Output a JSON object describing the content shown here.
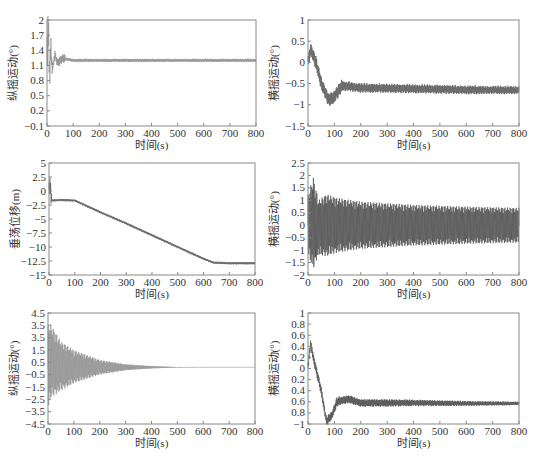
{
  "chart_data": [
    {
      "id": "top-left",
      "type": "line",
      "title": "",
      "xlabel": "时间(s)",
      "ylabel": "纵摇运动(°)",
      "xlim": [
        0,
        800
      ],
      "ylim": [
        -0.1,
        2
      ],
      "xticks": [
        0,
        100,
        200,
        300,
        400,
        500,
        600,
        700,
        800
      ],
      "yticks": [
        2,
        1.7,
        1.4,
        1.1,
        0.8,
        0.5,
        0.2,
        -0.1
      ],
      "ytick_labels": [
        "2",
        "1.7",
        "1.4",
        "1.1",
        "0.8",
        "0.5",
        "0.2",
        "−0.1"
      ],
      "grid": false,
      "color": "#8a8a8a",
      "description": "Damped oscillation: large swings 0.8–1.95 in first 20 s, settling by ~60 s to a steady ~1.2 with small ±0.03 ripple",
      "series": [
        {
          "name": "pitch",
          "x": [
            0,
            5,
            10,
            15,
            20,
            30,
            40,
            60,
            100,
            200,
            400,
            600,
            800
          ],
          "y": [
            1.1,
            1.95,
            0.85,
            1.5,
            1.0,
            1.32,
            1.15,
            1.24,
            1.2,
            1.2,
            1.2,
            1.2,
            1.2
          ]
        }
      ]
    },
    {
      "id": "top-right",
      "type": "line",
      "title": "",
      "xlabel": "时间(s)",
      "ylabel": "横摇运动(°)",
      "xlim": [
        0,
        800
      ],
      "ylim": [
        -1.5,
        1
      ],
      "xticks": [
        0,
        100,
        200,
        300,
        400,
        500,
        600,
        700,
        800
      ],
      "yticks": [
        1,
        0.5,
        0,
        -0.5,
        -1,
        -1.5
      ],
      "ytick_labels": [
        "1",
        "0.5",
        "0",
        "−0.5",
        "−1",
        "−1.5"
      ],
      "grid": false,
      "color": "#555555",
      "description": "Dense oscillation; peaks ~0.5 near 10 s, drifts down to ~-1.1 at 80 s, recovers to band -0.4..-0.8 around 120 s, then narrows to -0.55..-0.75 by 800 s; final spike to -1.2",
      "series": [
        {
          "name": "roll-mean",
          "x": [
            0,
            10,
            30,
            50,
            80,
            100,
            130,
            200,
            400,
            600,
            800
          ],
          "y": [
            0,
            0.3,
            0,
            -0.5,
            -0.9,
            -0.8,
            -0.55,
            -0.6,
            -0.62,
            -0.65,
            -0.65
          ]
        }
      ]
    },
    {
      "id": "middle-left",
      "type": "line",
      "title": "",
      "xlabel": "时间(s)",
      "ylabel": "垂荡位移(m)",
      "xlim": [
        0,
        800
      ],
      "ylim": [
        -15,
        5
      ],
      "xticks": [
        0,
        100,
        200,
        300,
        400,
        500,
        600,
        700,
        800
      ],
      "yticks": [
        5,
        2.5,
        0,
        -2.5,
        -5,
        -7.5,
        -10,
        -12.5,
        -15
      ],
      "ytick_labels": [
        "5",
        "2.5",
        "0",
        "−2.5",
        "−5",
        "−7.5",
        "−10",
        "−12.5",
        "−15"
      ],
      "grid": false,
      "color": "#555555",
      "description": "Initial transient 1 to -3 at t<10 s, plateau ~-1.7 until 100 s, linear descent to ~-12.8 at 640 s, then flat ~-12.9 to 800 s",
      "series": [
        {
          "name": "heave",
          "x": [
            0,
            5,
            10,
            50,
            100,
            200,
            300,
            400,
            500,
            600,
            640,
            700,
            800
          ],
          "y": [
            0,
            1,
            -1.7,
            -1.6,
            -1.7,
            -3.8,
            -5.8,
            -7.9,
            -10.0,
            -12.1,
            -12.8,
            -12.9,
            -12.9
          ]
        }
      ]
    },
    {
      "id": "middle-right",
      "type": "line",
      "title": "",
      "xlabel": "时间(s)",
      "ylabel": "横摇运动(°)",
      "xlim": [
        0,
        800
      ],
      "ylim": [
        -2,
        2.5
      ],
      "xticks": [
        0,
        100,
        200,
        300,
        400,
        500,
        600,
        700,
        800
      ],
      "yticks": [
        2.5,
        2,
        1.5,
        1,
        0.5,
        0,
        -0.5,
        -1,
        -1.5,
        -2
      ],
      "ytick_labels": [
        "2.5",
        "2",
        "1.5",
        "1",
        "0.5",
        "0",
        "−0.5",
        "−1",
        "−1.5",
        "−2"
      ],
      "grid": false,
      "color": "#444444",
      "description": "Dense oscillation about 0; envelope ±1.9 near 20 s, ±1.2 at 70–110 s, decaying to about ±0.7 by 800 s",
      "series": [
        {
          "name": "upper-envelope",
          "x": [
            0,
            20,
            40,
            70,
            110,
            200,
            400,
            600,
            800
          ],
          "y": [
            1.2,
            1.95,
            1.0,
            1.25,
            1.1,
            0.95,
            0.82,
            0.75,
            0.7
          ]
        },
        {
          "name": "lower-envelope",
          "x": [
            0,
            20,
            40,
            70,
            110,
            200,
            400,
            600,
            800
          ],
          "y": [
            -1.2,
            -1.75,
            -1.2,
            -1.25,
            -1.1,
            -0.95,
            -0.82,
            -0.75,
            -0.7
          ]
        }
      ]
    },
    {
      "id": "bottom-left",
      "type": "line",
      "title": "",
      "xlabel": "时间(s)",
      "ylabel": "纵摇运动(°)",
      "xlim": [
        0,
        800
      ],
      "ylim": [
        -4.5,
        4.5
      ],
      "xticks": [
        0,
        100,
        200,
        300,
        400,
        500,
        600,
        700,
        800
      ],
      "yticks": [
        4.5,
        3.5,
        2.5,
        1.5,
        0.5,
        -0.5,
        -1.5,
        -2.5,
        -3.5,
        -4.5
      ],
      "ytick_labels": [
        "4.5",
        "3.5",
        "3.5",
        "1.5",
        "0.5",
        "−0.5",
        "−1.5",
        "−2.5",
        "−3.5",
        "−4.5"
      ],
      "grid": false,
      "color": "#8a8a8a",
      "description": "Damped oscillation centered ~0.1; initial amplitude ~3.5 at 0–10 s decaying exponentially to near 0 by ~450 s",
      "series": [
        {
          "name": "upper-envelope",
          "x": [
            0,
            10,
            50,
            100,
            200,
            300,
            400,
            500,
            800
          ],
          "y": [
            3.5,
            3.6,
            2.2,
            1.5,
            0.7,
            0.35,
            0.2,
            0.12,
            0.1
          ]
        },
        {
          "name": "lower-envelope",
          "x": [
            0,
            10,
            50,
            100,
            200,
            300,
            400,
            500,
            800
          ],
          "y": [
            -3.5,
            -2.4,
            -1.8,
            -1.2,
            -0.5,
            -0.15,
            0.0,
            0.08,
            0.1
          ]
        }
      ]
    },
    {
      "id": "bottom-right",
      "type": "line",
      "title": "",
      "xlabel": "时间(s)",
      "ylabel": "横摇运动(°)",
      "xlim": [
        0,
        800
      ],
      "ylim": [
        -1,
        1
      ],
      "xticks": [
        0,
        100,
        200,
        300,
        400,
        500,
        600,
        700,
        800
      ],
      "yticks": [
        1,
        0.8,
        0.6,
        0.4,
        0.2,
        0,
        -0.2,
        -0.4,
        -0.6,
        -0.8,
        -1
      ],
      "ytick_labels": [
        "1",
        "0.8",
        "0.6",
        "0.4",
        "0.2",
        "0",
        "0.2",
        "0.4",
        "0.6",
        "0.8",
        "−1"
      ],
      "grid": false,
      "color": "#444444",
      "description": "Rises to ~0.45 at 10 s, falls to ~-0.95 at 70–90 s, recovers to ~-0.6 by 110 s with ±0.1 ripple decaying to ±0.04 by 800 s",
      "series": [
        {
          "name": "roll",
          "x": [
            0,
            10,
            20,
            30,
            50,
            70,
            90,
            110,
            150,
            200,
            400,
            600,
            800
          ],
          "y": [
            0,
            0.45,
            0.2,
            0.0,
            -0.4,
            -0.95,
            -0.85,
            -0.6,
            -0.55,
            -0.62,
            -0.62,
            -0.63,
            -0.63
          ]
        }
      ]
    }
  ]
}
